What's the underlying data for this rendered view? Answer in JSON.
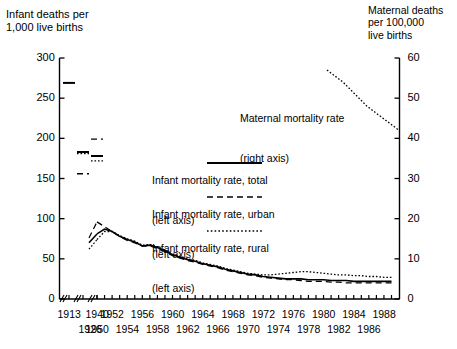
{
  "axes": {
    "left_title": "Infant deaths per\n1,000 live births",
    "right_title": "Maternal deaths\nper 100,000\nlive births",
    "left_ticks": [
      "300",
      "250",
      "200",
      "150",
      "100",
      "50",
      "0"
    ],
    "left_tick_values": [
      300,
      250,
      200,
      150,
      100,
      50,
      0
    ],
    "right_ticks": [
      "60",
      "50",
      "40",
      "30",
      "20",
      "10",
      "0"
    ],
    "right_tick_values": [
      60,
      50,
      40,
      30,
      20,
      10,
      0
    ],
    "x_ticks_top_row": [
      "1913",
      "1940",
      "1952",
      "1956",
      "1960",
      "1964",
      "1968",
      "1972",
      "1976",
      "1980",
      "1984",
      "1988"
    ],
    "x_ticks_bottom_row": [
      "1926",
      "1950",
      "1954",
      "1958",
      "1962",
      "1966",
      "1970",
      "1974",
      "1978",
      "1982",
      "1986"
    ],
    "axis_break": true
  },
  "legend": {
    "items": [
      {
        "label_line1": "Infant mortality rate, total",
        "label_line2": "(left axis)",
        "style": "solid"
      },
      {
        "label_line1": "Infant mortality rate, urban",
        "label_line2": "(left axis)",
        "style": "dashed"
      },
      {
        "label_line1": "Infant mortality rate, rural",
        "label_line2": "(left axis)",
        "style": "dotted"
      }
    ]
  },
  "annotations": [
    {
      "line1": "Maternal mortality rate",
      "line2": "(right axis)",
      "style": "dotted"
    }
  ],
  "chart_data": {
    "type": "line",
    "title": "",
    "xlabel": "",
    "ylabel": "Infant deaths per 1,000 live births",
    "ylabel_right": "Maternal deaths per 100,000 live births",
    "ylim": [
      0,
      300
    ],
    "ylim_right": [
      0,
      60
    ],
    "grid": false,
    "legend_position": "inside-upper-center",
    "x_axis_note": "Discontinuous: isolated early years 1913, 1926, 1940 then continuous annual series from 1950 to 1989",
    "series": [
      {
        "name": "Infant mortality rate, total",
        "axis": "left",
        "style": "solid",
        "points": [
          {
            "year": 1913,
            "value": 269
          },
          {
            "year": 1926,
            "value": 183
          },
          {
            "year": 1940,
            "value": 178
          }
        ],
        "continuous": {
          "x": [
            1950,
            1951,
            1952,
            1953,
            1954,
            1955,
            1956,
            1957,
            1958,
            1959,
            1960,
            1961,
            1962,
            1963,
            1964,
            1965,
            1966,
            1967,
            1968,
            1969,
            1970,
            1971,
            1972,
            1973,
            1974,
            1975,
            1976,
            1977,
            1978,
            1979,
            1980,
            1981,
            1982,
            1983,
            1984,
            1985,
            1986,
            1987,
            1988,
            1989
          ],
          "y": [
            81,
            87,
            84,
            78,
            74,
            71,
            66,
            67,
            64,
            60,
            55,
            52,
            49,
            47,
            44,
            42,
            40,
            37,
            35,
            33,
            31,
            30,
            28,
            27,
            26,
            25,
            25,
            25,
            24,
            24,
            24,
            23,
            23,
            23,
            22,
            22,
            22,
            22,
            22,
            22
          ]
        }
      },
      {
        "name": "Infant mortality rate, urban",
        "axis": "left",
        "style": "dashed",
        "points": [
          {
            "year": 1926,
            "value": 156
          },
          {
            "year": 1940,
            "value": 199
          }
        ],
        "continuous": {
          "x": [
            1950,
            1951,
            1952,
            1953,
            1954,
            1955,
            1956,
            1957,
            1958,
            1959,
            1960,
            1961,
            1962,
            1963,
            1964,
            1965,
            1966,
            1967,
            1968,
            1969,
            1970,
            1971,
            1972,
            1973,
            1974,
            1975,
            1976,
            1977,
            1978,
            1979,
            1980,
            1981,
            1982,
            1983,
            1984,
            1985,
            1986,
            1987,
            1988,
            1989
          ],
          "y": [
            96,
            90,
            84,
            78,
            73,
            70,
            66,
            66,
            63,
            59,
            54,
            51,
            48,
            46,
            43,
            41,
            39,
            36,
            34,
            32,
            30,
            29,
            27,
            26,
            25,
            24,
            24,
            23,
            22,
            22,
            22,
            21,
            21,
            20,
            20,
            20,
            20,
            20,
            20,
            20
          ]
        }
      },
      {
        "name": "Infant mortality rate, rural",
        "axis": "left",
        "style": "dotted",
        "points": [
          {
            "year": 1926,
            "value": 181
          },
          {
            "year": 1940,
            "value": 172
          }
        ],
        "continuous": {
          "x": [
            1950,
            1951,
            1952,
            1953,
            1954,
            1955,
            1956,
            1957,
            1958,
            1959,
            1960,
            1961,
            1962,
            1963,
            1964,
            1965,
            1966,
            1967,
            1968,
            1969,
            1970,
            1971,
            1972,
            1973,
            1974,
            1975,
            1976,
            1977,
            1978,
            1979,
            1980,
            1981,
            1982,
            1983,
            1984,
            1985,
            1986,
            1987,
            1988,
            1989
          ],
          "y": [
            74,
            84,
            84,
            79,
            75,
            72,
            67,
            68,
            65,
            61,
            56,
            53,
            50,
            48,
            45,
            43,
            41,
            38,
            36,
            34,
            32,
            31,
            30,
            30,
            31,
            32,
            33,
            34,
            34,
            33,
            32,
            31,
            30,
            30,
            29,
            29,
            28,
            28,
            27,
            27
          ]
        }
      },
      {
        "name": "Maternal mortality rate",
        "axis": "right",
        "style": "dotted",
        "continuous": {
          "x": [
            1980,
            1981,
            1982,
            1983,
            1984,
            1985,
            1986,
            1987,
            1988,
            1989
          ],
          "y": [
            57.0,
            55.5,
            54.0,
            52.0,
            50.0,
            48.0,
            46.5,
            45.0,
            43.5,
            42.0
          ]
        }
      }
    ]
  }
}
